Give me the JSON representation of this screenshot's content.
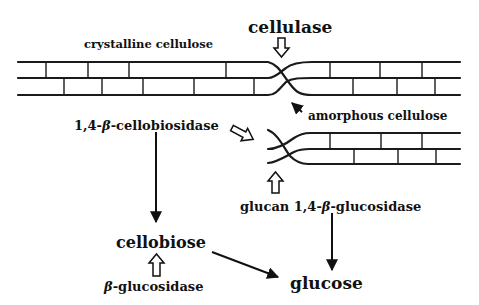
{
  "labels": {
    "cellulase": "cellulase",
    "crystalline": "crystalline cellulose",
    "amorphous": "amorphous cellulose",
    "cellobiosidase_pre": "1,4-",
    "cellobiosidase_beta": "β",
    "cellobiosidase_post": "-cellobiosidase",
    "glucan_pre": "glucan 1,4-",
    "glucan_beta": "β",
    "glucan_post": "-glucosidase",
    "cellobiose": "cellobiose",
    "bgluc_beta": "β",
    "bgluc_post": "-glucosidase",
    "glucose": "glucose"
  },
  "colors": {
    "ink": "#111111",
    "background": "#ffffff"
  }
}
